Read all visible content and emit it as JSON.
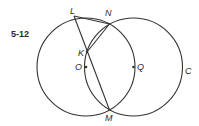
{
  "figure": {
    "label": "5-12"
  },
  "circles": [
    {
      "name": "left-circle",
      "cx": 86,
      "cy": 67,
      "r": 49
    },
    {
      "name": "circle-C",
      "cx": 133.5,
      "cy": 67,
      "r": 49,
      "label": "C"
    }
  ],
  "points": {
    "L": {
      "label": "L",
      "x": 74,
      "y": 16
    },
    "N": {
      "label": "N",
      "x": 109.5,
      "y": 24
    },
    "K": {
      "label": "K",
      "x": 87,
      "y": 52
    },
    "O": {
      "label": "O",
      "x": 86,
      "y": 67
    },
    "Q": {
      "label": "Q",
      "x": 133.5,
      "y": 67
    },
    "M": {
      "label": "M",
      "x": 109.5,
      "y": 110
    }
  },
  "colors": {
    "line": "#333333",
    "text": "#2a2a2a",
    "background": "#ffffff"
  }
}
